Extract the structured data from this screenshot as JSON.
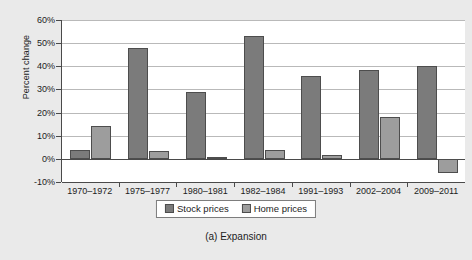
{
  "chart_data": {
    "type": "bar",
    "title": "",
    "caption": "(a) Expansion",
    "xlabel": "",
    "ylabel": "Percent change",
    "ylim": [
      -10,
      60
    ],
    "ytick_labels": [
      "60%",
      "50%",
      "40%",
      "30%",
      "20%",
      "10%",
      "0%",
      "-10%"
    ],
    "ytick_values": [
      60,
      50,
      40,
      30,
      20,
      10,
      0,
      -10
    ],
    "grid": true,
    "legend_position": "bottom-center",
    "categories": [
      "1970–1972",
      "1975–1977",
      "1980–1981",
      "1982–1984",
      "1991–1993",
      "2002–2004",
      "2009–2011"
    ],
    "series": [
      {
        "name": "Stock prices",
        "color": "#7b7b7b",
        "values": [
          4,
          48,
          29,
          53,
          36,
          38.5,
          40
        ]
      },
      {
        "name": "Home prices",
        "color": "#9d9d9d",
        "values": [
          14,
          3.5,
          1,
          4,
          1.5,
          18,
          -6
        ]
      }
    ]
  },
  "colors": {
    "background": "#eaeaea",
    "plot_background": "#ffffff",
    "axis": "#4a4a4a",
    "grid": "#b9b9b9",
    "text": "#1c1c1c"
  }
}
